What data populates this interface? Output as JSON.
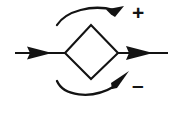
{
  "diagram": {
    "type": "control-system-block-diagram",
    "canvas": {
      "width": 182,
      "height": 126,
      "background": "#ffffff"
    },
    "stroke_color": "#131313",
    "fill_color": "#131313",
    "labels": {
      "plus": "+",
      "minus": "–"
    },
    "elements": [
      {
        "name": "summing-junction-diamond",
        "shape": "diamond",
        "left_vertex": [
          65,
          53
        ],
        "top_vertex": [
          91,
          25
        ],
        "right_vertex": [
          118,
          53
        ],
        "bottom_vertex": [
          91,
          79
        ],
        "fill": "none",
        "stroke_width": 2
      },
      {
        "name": "input-arrow",
        "direction": "right",
        "from": [
          15,
          53
        ],
        "to": [
          65,
          53
        ],
        "arrowhead_at": [
          52,
          53
        ]
      },
      {
        "name": "output-arrow",
        "direction": "right",
        "from": [
          118,
          53
        ],
        "to": [
          168,
          53
        ],
        "arrowhead_at": [
          152,
          53
        ]
      },
      {
        "name": "positive-input-curved-arrow",
        "curve": "arc",
        "from": [
          57,
          24
        ],
        "to": [
          122,
          7
        ],
        "arrowhead_direction": "up-right",
        "associated_label": "+"
      },
      {
        "name": "negative-input-curved-arrow",
        "curve": "arc",
        "from": [
          57,
          82
        ],
        "to": [
          128,
          72
        ],
        "arrowhead_direction": "up-right",
        "associated_label": "–"
      }
    ]
  }
}
